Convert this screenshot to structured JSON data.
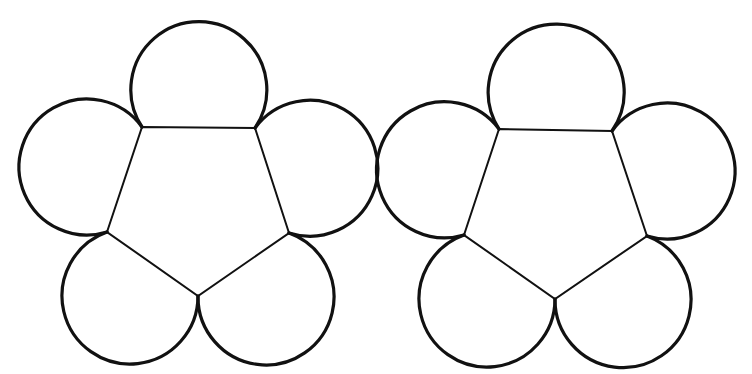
{
  "diagram": {
    "stroke_color": "#111111",
    "background_color": "#ffffff",
    "petal_radius": 68,
    "figures": [
      {
        "name": "left-flower",
        "vertices": [
          [
            142,
            127
          ],
          [
            255,
            128
          ],
          [
            289,
            233
          ],
          [
            198,
            296
          ],
          [
            107,
            232
          ]
        ]
      },
      {
        "name": "right-flower",
        "vertices": [
          [
            499,
            129
          ],
          [
            612,
            131
          ],
          [
            647,
            236
          ],
          [
            555,
            299
          ],
          [
            464,
            235
          ]
        ]
      }
    ]
  }
}
